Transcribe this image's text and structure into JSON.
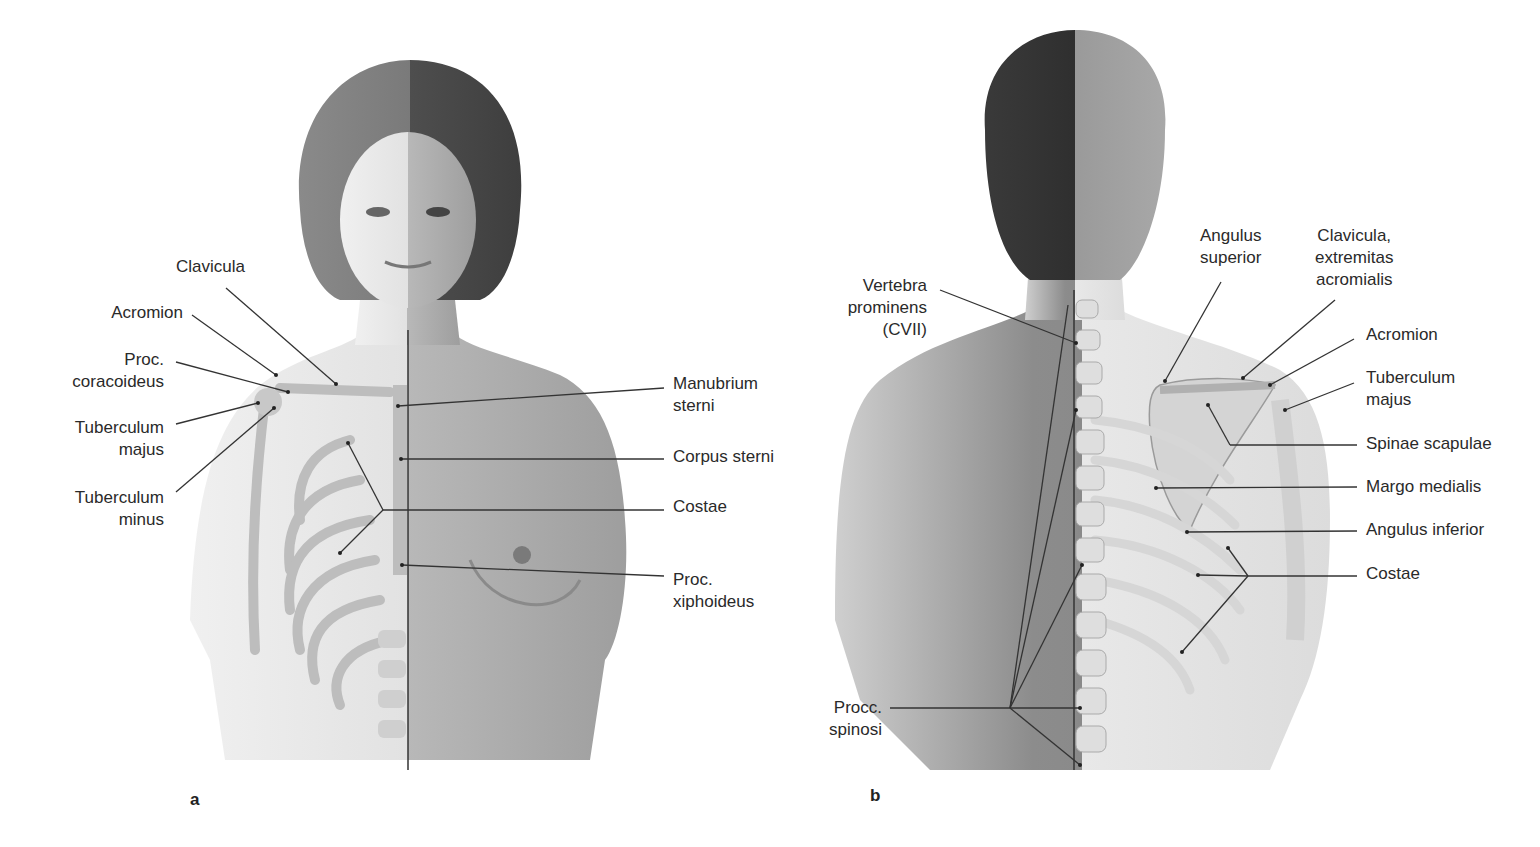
{
  "figure_a": {
    "panel_letter": "a",
    "view": "anterior",
    "labels_left": [
      {
        "id": "clavicula",
        "lines": [
          "Clavicula"
        ]
      },
      {
        "id": "acromion",
        "lines": [
          "Acromion"
        ]
      },
      {
        "id": "proc-coracoideus",
        "lines": [
          "Proc.",
          "coracoideus"
        ]
      },
      {
        "id": "tuberculum-majus",
        "lines": [
          "Tuberculum",
          "majus"
        ]
      },
      {
        "id": "tuberculum-minus",
        "lines": [
          "Tuberculum",
          "minus"
        ]
      }
    ],
    "labels_right": [
      {
        "id": "manubrium-sterni",
        "lines": [
          "Manubrium",
          "sterni"
        ]
      },
      {
        "id": "corpus-sterni",
        "lines": [
          "Corpus sterni"
        ]
      },
      {
        "id": "costae",
        "lines": [
          "Costae"
        ]
      },
      {
        "id": "proc-xiphoideus",
        "lines": [
          "Proc.",
          "xiphoideus"
        ]
      }
    ]
  },
  "figure_b": {
    "panel_letter": "b",
    "view": "posterior",
    "labels_left": [
      {
        "id": "vertebra-prominens",
        "lines": [
          "Vertebra",
          "prominens",
          "(CVII)"
        ]
      },
      {
        "id": "procc-spinosi",
        "lines": [
          "Procc.",
          "spinosi"
        ]
      }
    ],
    "labels_top": [
      {
        "id": "angulus-superior",
        "lines": [
          "Angulus",
          "superior"
        ]
      },
      {
        "id": "clavicula-extremitas-acromialis",
        "lines": [
          "Clavicula,",
          "extremitas",
          "acromialis"
        ]
      }
    ],
    "labels_right": [
      {
        "id": "acromion",
        "lines": [
          "Acromion"
        ]
      },
      {
        "id": "tuberculum-majus",
        "lines": [
          "Tuberculum",
          "majus"
        ]
      },
      {
        "id": "spinae-scapulae",
        "lines": [
          "Spinae scapulae"
        ]
      },
      {
        "id": "margo-medialis",
        "lines": [
          "Margo medialis"
        ]
      },
      {
        "id": "angulus-inferior",
        "lines": [
          "Angulus inferior"
        ]
      },
      {
        "id": "costae",
        "lines": [
          "Costae"
        ]
      }
    ]
  },
  "colors": {
    "background": "#ffffff",
    "text": "#2a2a2a",
    "leader_line": "#333333",
    "skin_light": "#e6e6e6",
    "skin_dark": "#9a9a9a",
    "bone": "#c9c9c9",
    "hair": "#4a4a4a"
  }
}
